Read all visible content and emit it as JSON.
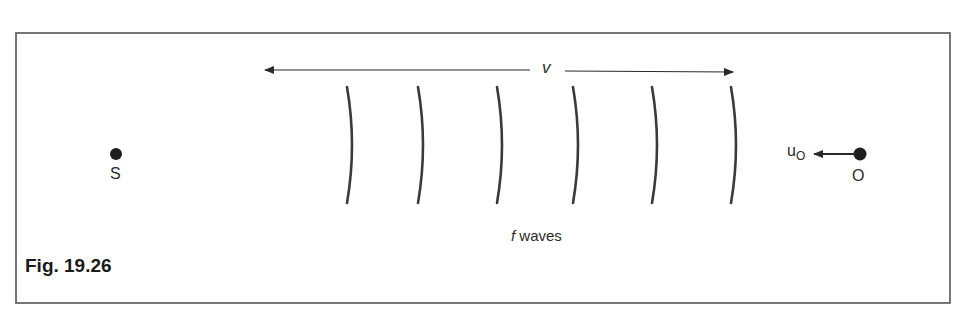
{
  "figure": {
    "caption": "Fig. 19.26",
    "source_label": "S",
    "observer_label": "O",
    "observer_velocity_label": "u",
    "observer_velocity_subscript": "O",
    "wave_speed_label": "v",
    "wave_count_label_italic": "f",
    "wave_count_label_rest": " waves",
    "wavefront_count": 6,
    "colors": {
      "frame": "#555555",
      "ink": "#2a2a2a",
      "background": "#ffffff"
    }
  }
}
